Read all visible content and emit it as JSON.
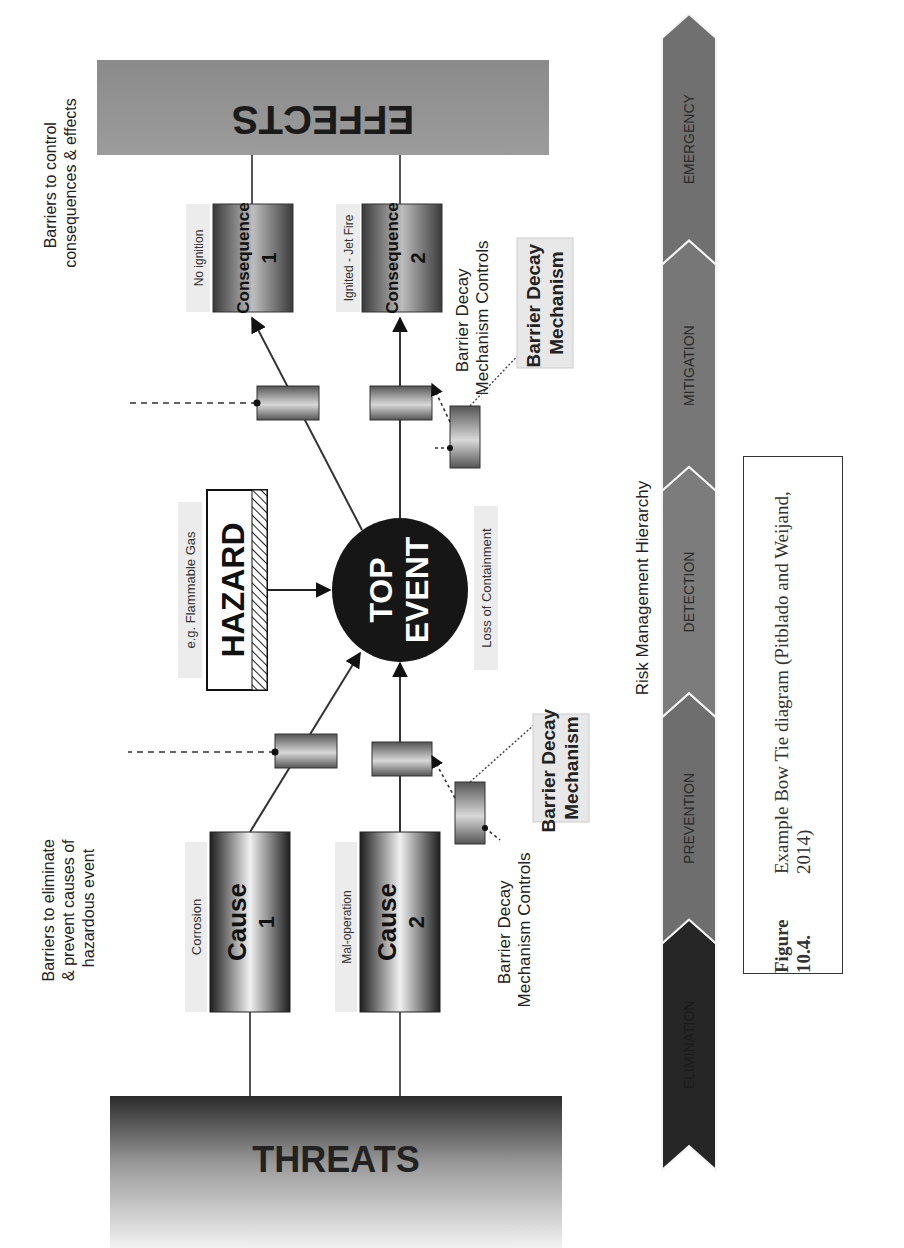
{
  "diagram": {
    "threats": "THREATS",
    "effects": "EFFECTS",
    "hazard": {
      "label": "HAZARD",
      "example": "e.g. Flammable Gas"
    },
    "top_event": {
      "line1": "TOP",
      "line2": "EVENT",
      "description": "Loss of Containment"
    },
    "causes": [
      {
        "title": "Cause",
        "number": "1",
        "tag": "Corrosion"
      },
      {
        "title": "Cause",
        "number": "2",
        "tag": "Mal-operation"
      }
    ],
    "consequences": [
      {
        "title": "Consequence",
        "number": "1",
        "tag": "No ignition"
      },
      {
        "title": "Consequence",
        "number": "2",
        "tag": "Ignited - Jet Fire"
      }
    ],
    "annotations": {
      "left_barriers": [
        "Barriers to eliminate",
        "& prevent causes of",
        "hazardous event"
      ],
      "right_barriers": [
        "Barriers to control",
        "consequences & effects"
      ]
    },
    "decay_controls": [
      "Barrier Decay",
      "Mechanism Controls"
    ],
    "decay_mechanism": [
      "Barrier Decay",
      "Mechanism"
    ],
    "hierarchy": {
      "title": "Risk Management Hierarchy",
      "stages": [
        "ELIMINATION",
        "PREVENTION",
        "DETECTION",
        "MITIGATION",
        "EMERGENCY"
      ],
      "colors": [
        "#262626",
        "#6e6e6e",
        "#7c7c7c",
        "#777777",
        "#707070"
      ]
    }
  },
  "caption": {
    "label": "Figure 10.4.",
    "text": "Example Bow Tie diagram (Pitblado and Weijand, 2014)"
  }
}
